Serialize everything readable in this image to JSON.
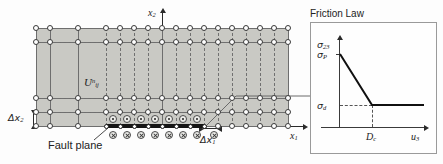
{
  "figure": {
    "labels": {
      "axis_x1": "x",
      "axis_x1_sub": "1",
      "axis_x2": "x",
      "axis_x2_sub": "2",
      "grid_spacing_x1": "Δx",
      "grid_spacing_x1_sub": "1",
      "grid_spacing_x2": "Δx",
      "grid_spacing_x2_sub": "2",
      "displacement_symbol": "U",
      "displacement_sub": "ij",
      "displacement_sup": "n",
      "fault_plane": "Fault plane"
    },
    "mesh": {
      "node_columns": 18,
      "node_rows": 5,
      "fault_segments": 6,
      "fill_color": "#c9c9c4",
      "node_fill": "#ffffff",
      "node_stroke": "#3a3a3a",
      "fault_color": "#151515"
    },
    "fault_symbols": {
      "above": "circled-dot",
      "below": "circled-cross",
      "count_above": 6,
      "count_below": 7
    }
  },
  "chart_data": {
    "type": "line",
    "title": "Friction Law",
    "xlabel": "u3",
    "ylabel": "sigma23",
    "xlabel_base": "u",
    "xlabel_sub": "3",
    "ylabel_base": "σ",
    "ylabel_sub": "23",
    "x": [
      0,
      1,
      2.6
    ],
    "y": [
      1,
      0.28,
      0.28
    ],
    "xlim": [
      0,
      2.9
    ],
    "ylim": [
      0,
      1.18
    ],
    "grid": false,
    "legend": null,
    "annotations": [
      {
        "name": "peak-stress",
        "base": "σ",
        "sub": "P",
        "axis": "y",
        "value": 1
      },
      {
        "name": "dynamic-stress",
        "base": "σ",
        "sub": "d",
        "axis": "y",
        "value": 0.28
      },
      {
        "name": "critical-slip-distance",
        "base": "D",
        "sub": "c",
        "axis": "x",
        "value": 1
      }
    ],
    "series": [
      {
        "name": "slip-weakening",
        "values": [
          1,
          0.28,
          0.28
        ]
      }
    ]
  }
}
